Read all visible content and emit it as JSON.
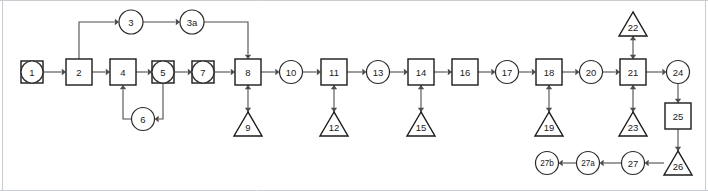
{
  "diagram": {
    "canvas": {
      "width": 708,
      "height": 191,
      "background": "#ffffff",
      "border_color": "#c9ccd1"
    },
    "style": {
      "node_stroke": "#1a1a1a",
      "node_fill": "#ffffff",
      "edge_stroke": "#4d4d4d",
      "label_color": "#1a1a1a"
    },
    "nodes": [
      {
        "id": "1",
        "label": "1",
        "shape": "circle-in-square",
        "x": 32,
        "y": 72,
        "w": 22,
        "h": 22
      },
      {
        "id": "2",
        "label": "2",
        "shape": "square",
        "x": 79,
        "y": 72,
        "w": 26,
        "h": 26
      },
      {
        "id": "3",
        "label": "3",
        "shape": "circle",
        "x": 131,
        "y": 22,
        "w": 24,
        "h": 24
      },
      {
        "id": "3a",
        "label": "3a",
        "shape": "circle",
        "x": 192,
        "y": 22,
        "w": 24,
        "h": 24
      },
      {
        "id": "4",
        "label": "4",
        "shape": "square",
        "x": 123,
        "y": 72,
        "w": 26,
        "h": 26
      },
      {
        "id": "5",
        "label": "5",
        "shape": "circle-in-square",
        "x": 163,
        "y": 72,
        "w": 22,
        "h": 22
      },
      {
        "id": "6",
        "label": "6",
        "shape": "circle",
        "x": 143,
        "y": 119,
        "w": 23,
        "h": 23
      },
      {
        "id": "7",
        "label": "7",
        "shape": "circle-in-square",
        "x": 203,
        "y": 72,
        "w": 22,
        "h": 22
      },
      {
        "id": "8",
        "label": "8",
        "shape": "square",
        "x": 248,
        "y": 72,
        "w": 26,
        "h": 26
      },
      {
        "id": "9",
        "label": "9",
        "shape": "triangle",
        "x": 248,
        "y": 124,
        "w": 28,
        "h": 24
      },
      {
        "id": "10",
        "label": "10",
        "shape": "circle",
        "x": 291,
        "y": 72,
        "w": 23,
        "h": 23
      },
      {
        "id": "11",
        "label": "11",
        "shape": "square",
        "x": 334,
        "y": 72,
        "w": 26,
        "h": 26
      },
      {
        "id": "12",
        "label": "12",
        "shape": "triangle",
        "x": 334,
        "y": 124,
        "w": 28,
        "h": 24
      },
      {
        "id": "13",
        "label": "13",
        "shape": "circle",
        "x": 378,
        "y": 72,
        "w": 23,
        "h": 23
      },
      {
        "id": "14",
        "label": "14",
        "shape": "square",
        "x": 421,
        "y": 72,
        "w": 26,
        "h": 26
      },
      {
        "id": "15",
        "label": "15",
        "shape": "triangle",
        "x": 421,
        "y": 124,
        "w": 28,
        "h": 24
      },
      {
        "id": "16",
        "label": "16",
        "shape": "square",
        "x": 465,
        "y": 72,
        "w": 26,
        "h": 26
      },
      {
        "id": "17",
        "label": "17",
        "shape": "circle",
        "x": 507,
        "y": 72,
        "w": 23,
        "h": 23
      },
      {
        "id": "18",
        "label": "18",
        "shape": "square",
        "x": 549,
        "y": 72,
        "w": 26,
        "h": 26
      },
      {
        "id": "19",
        "label": "19",
        "shape": "triangle",
        "x": 549,
        "y": 124,
        "w": 28,
        "h": 24
      },
      {
        "id": "20",
        "label": "20",
        "shape": "circle",
        "x": 591,
        "y": 72,
        "w": 23,
        "h": 23
      },
      {
        "id": "21",
        "label": "21",
        "shape": "square",
        "x": 633,
        "y": 72,
        "w": 26,
        "h": 26
      },
      {
        "id": "22",
        "label": "22",
        "shape": "triangle",
        "x": 633,
        "y": 24,
        "w": 28,
        "h": 24
      },
      {
        "id": "23",
        "label": "23",
        "shape": "triangle",
        "x": 633,
        "y": 124,
        "w": 28,
        "h": 24
      },
      {
        "id": "24",
        "label": "24",
        "shape": "circle",
        "x": 678,
        "y": 72,
        "w": 23,
        "h": 23
      },
      {
        "id": "25",
        "label": "25",
        "shape": "square",
        "x": 678,
        "y": 116,
        "w": 26,
        "h": 26
      },
      {
        "id": "26",
        "label": "26",
        "shape": "triangle",
        "x": 678,
        "y": 163,
        "w": 28,
        "h": 24
      },
      {
        "id": "27",
        "label": "27",
        "shape": "circle",
        "x": 633,
        "y": 163,
        "w": 23,
        "h": 23
      },
      {
        "id": "27a",
        "label": "27a",
        "shape": "circle",
        "x": 588,
        "y": 163,
        "w": 23,
        "h": 23
      },
      {
        "id": "27b",
        "label": "27b",
        "shape": "circle",
        "x": 547,
        "y": 163,
        "w": 23,
        "h": 23
      }
    ],
    "edges": [
      {
        "from": "1",
        "to": "2",
        "kind": "straight",
        "arrow": "end"
      },
      {
        "from": "2",
        "to": "4",
        "kind": "straight",
        "arrow": "end"
      },
      {
        "from": "2",
        "to": "3",
        "kind": "elbow-up",
        "arrow": "end"
      },
      {
        "from": "3",
        "to": "3a",
        "kind": "straight",
        "arrow": "end"
      },
      {
        "from": "3a",
        "to": "8",
        "kind": "elbow-down",
        "arrow": "end"
      },
      {
        "from": "4",
        "to": "5",
        "kind": "straight",
        "arrow": "end"
      },
      {
        "from": "5",
        "to": "6",
        "kind": "elbow-loop",
        "arrow": "end"
      },
      {
        "from": "6",
        "to": "4",
        "kind": "elbow-loop-back",
        "arrow": "end"
      },
      {
        "from": "5",
        "to": "7",
        "kind": "straight",
        "arrow": "end"
      },
      {
        "from": "7",
        "to": "8",
        "kind": "straight",
        "arrow": "end"
      },
      {
        "from": "8",
        "to": "9",
        "kind": "vertical",
        "arrow": "both"
      },
      {
        "from": "8",
        "to": "10",
        "kind": "straight",
        "arrow": "end"
      },
      {
        "from": "10",
        "to": "11",
        "kind": "straight",
        "arrow": "end"
      },
      {
        "from": "11",
        "to": "12",
        "kind": "vertical",
        "arrow": "both"
      },
      {
        "from": "11",
        "to": "13",
        "kind": "straight",
        "arrow": "end"
      },
      {
        "from": "13",
        "to": "14",
        "kind": "straight",
        "arrow": "end"
      },
      {
        "from": "14",
        "to": "15",
        "kind": "vertical",
        "arrow": "both"
      },
      {
        "from": "14",
        "to": "16",
        "kind": "straight",
        "arrow": "end"
      },
      {
        "from": "16",
        "to": "17",
        "kind": "straight",
        "arrow": "end"
      },
      {
        "from": "17",
        "to": "18",
        "kind": "straight",
        "arrow": "end"
      },
      {
        "from": "18",
        "to": "19",
        "kind": "vertical",
        "arrow": "both"
      },
      {
        "from": "18",
        "to": "20",
        "kind": "straight",
        "arrow": "end"
      },
      {
        "from": "20",
        "to": "21",
        "kind": "straight",
        "arrow": "end"
      },
      {
        "from": "21",
        "to": "22",
        "kind": "vertical",
        "arrow": "both"
      },
      {
        "from": "21",
        "to": "23",
        "kind": "vertical",
        "arrow": "both"
      },
      {
        "from": "21",
        "to": "24",
        "kind": "straight",
        "arrow": "end"
      },
      {
        "from": "24",
        "to": "25",
        "kind": "vertical",
        "arrow": "end"
      },
      {
        "from": "25",
        "to": "26",
        "kind": "vertical",
        "arrow": "end"
      },
      {
        "from": "26",
        "to": "27",
        "kind": "straight",
        "arrow": "end"
      },
      {
        "from": "27",
        "to": "27a",
        "kind": "straight",
        "arrow": "end"
      },
      {
        "from": "27a",
        "to": "27b",
        "kind": "straight",
        "arrow": "end"
      }
    ]
  }
}
